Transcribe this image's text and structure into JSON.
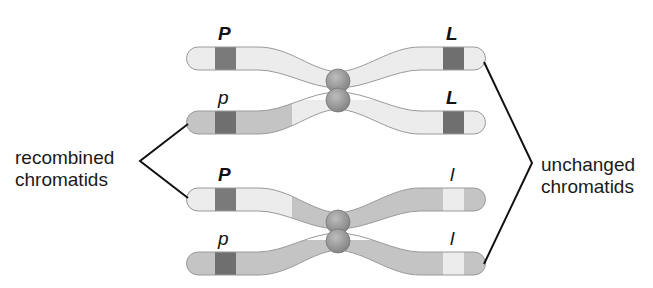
{
  "diagram": {
    "colors": {
      "light_chromatid": "#ececec",
      "dark_chromatid": "#c4c4c4",
      "dominant_band": "#7a7a7a",
      "recessive_band_light": "#f2f2f2",
      "centromere": "#9a9a9a",
      "outline": "#8a8a8a",
      "line": "#111111",
      "text": "#1a1a1a"
    },
    "labels": {
      "recombined_line1": "recombined",
      "recombined_line2": "chromatids",
      "unchanged_line1": "unchanged",
      "unchanged_line2": "chromatids"
    },
    "chromosomes": [
      {
        "name": "top-homolog",
        "chromatids": [
          {
            "id": "chromatid-1",
            "type": "unchanged",
            "left_allele": "P",
            "right_allele": "L"
          },
          {
            "id": "chromatid-2",
            "type": "recombined",
            "left_allele": "p",
            "right_allele": "L"
          }
        ]
      },
      {
        "name": "bottom-homolog",
        "chromatids": [
          {
            "id": "chromatid-3",
            "type": "recombined",
            "left_allele": "P",
            "right_allele": "l"
          },
          {
            "id": "chromatid-4",
            "type": "unchanged",
            "left_allele": "p",
            "right_allele": "l"
          }
        ]
      }
    ]
  }
}
